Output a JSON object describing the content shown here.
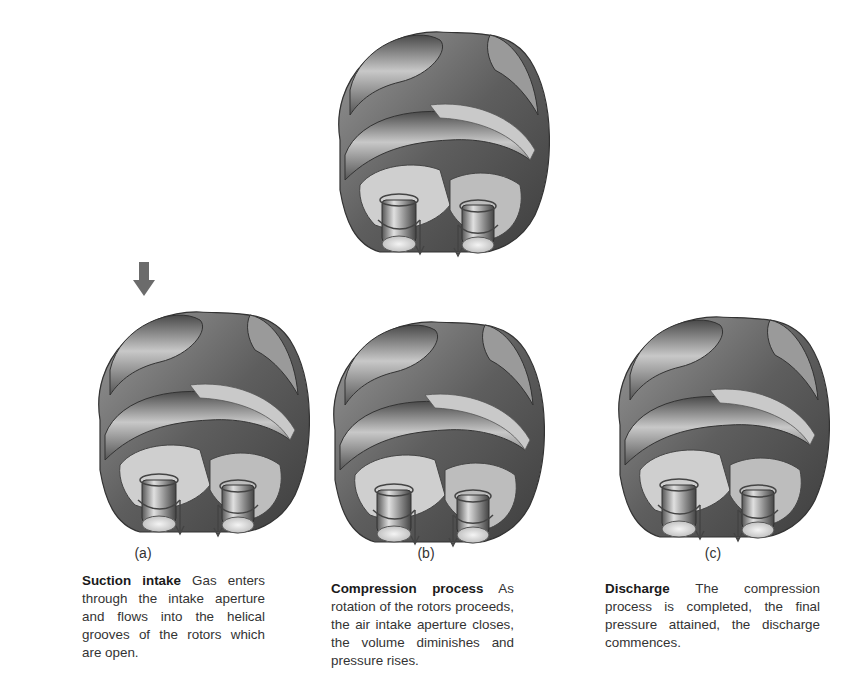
{
  "figure": {
    "type": "screw-compressor-operating-cycle",
    "top_illustration": {
      "name": "twin-screw-rotors-overview"
    },
    "arrow": {
      "name": "intake-flow-arrow",
      "direction": "down",
      "color": "#6b6b6b"
    },
    "panels": [
      {
        "label": "(a)",
        "title": "Suction intake",
        "text": "Gas enters through the intake aperture and flows into the helical grooves of the rotors which are open."
      },
      {
        "label": "(b)",
        "title": "Compression process",
        "text": "As rotation of the rotors proceeds, the air intake aperture closes, the volume diminishes and pressure rises."
      },
      {
        "label": "(c)",
        "title": "Discharge",
        "text": "The compression process is completed, the final pressure attained, the discharge commences."
      }
    ]
  },
  "colors": {
    "background": "#ffffff",
    "rotor_dark": "#5a5a5a",
    "rotor_mid": "#8c8c8c",
    "rotor_light": "#d6d6d6",
    "text": "#333333"
  }
}
